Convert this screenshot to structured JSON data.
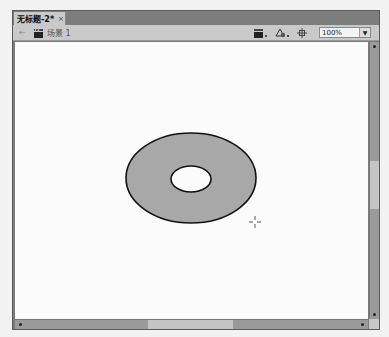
{
  "document_tab": {
    "title": "无标题-2*",
    "close_glyph": "×"
  },
  "edit_bar": {
    "back_icon": "←",
    "scene_label": "场景 1",
    "zoom": {
      "value": "100%",
      "arrow": "▼"
    }
  },
  "stage": {
    "shape": {
      "type": "ring",
      "fill": "#a8a8a8",
      "stroke": "#111111",
      "outer": {
        "cx": 190,
        "cy": 177,
        "rx": 65,
        "ry": 45
      },
      "inner": {
        "cx": 190,
        "cy": 178,
        "rx": 20,
        "ry": 13
      }
    },
    "cursor": {
      "type": "crosshair",
      "x": 254,
      "y": 221
    }
  },
  "colors": {
    "tab_bar": "#7d7d7d",
    "toolbar": "#c9c9c9",
    "canvas": "#fbfbfb",
    "scrollbar_track": "#9a9a9a",
    "scrollbar_thumb": "#c4c4c4"
  }
}
